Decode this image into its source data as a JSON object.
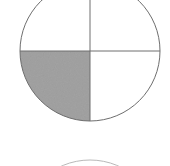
{
  "figure": {
    "background_color": "#ffffff",
    "canvas": {
      "width": 170,
      "height": 166
    }
  },
  "colors": {
    "outline": "#6e6e6e",
    "divider": "#6e6e6e",
    "shade_fill": "#a3a3a3",
    "shade_fill_light": "#b4b4b4",
    "background": "#ffffff",
    "faint_outline": "#b9b9b9"
  },
  "main_circle": {
    "name": "fraction-circle",
    "center_x": 90,
    "center_y": 51,
    "radius": 70,
    "stroke_width": 1,
    "clipped_edges": [
      "top",
      "left"
    ],
    "divisions": 4,
    "shaded_parts": 1,
    "fraction_label": "1/4"
  },
  "dividers": [
    {
      "name": "vertical-diameter",
      "orientation": "vertical",
      "x1": 90,
      "y1": -19,
      "x2": 90,
      "y2": 121
    },
    {
      "name": "horizontal-diameter",
      "orientation": "horizontal",
      "x1": 20,
      "y1": 51,
      "x2": 160,
      "y2": 51
    }
  ],
  "quadrants": [
    {
      "name": "quadrant-top-left",
      "position": "top-left",
      "shaded": false
    },
    {
      "name": "quadrant-top-right",
      "position": "top-right",
      "shaded": false
    },
    {
      "name": "quadrant-bottom-left",
      "position": "bottom-left",
      "shaded": true
    },
    {
      "name": "quadrant-bottom-right",
      "position": "bottom-right",
      "shaded": false
    }
  ],
  "shaded_sector_path": "M 90 51 L 20 51 A 70 70 0 0 0 90 121 Z",
  "secondary_circle": {
    "name": "second-fraction-circle-partial",
    "center_x": 90,
    "center_y": 230,
    "radius": 70,
    "stroke_width": 1,
    "visible_portion": "top-arc-only",
    "clipped_edges": [
      "bottom"
    ]
  }
}
